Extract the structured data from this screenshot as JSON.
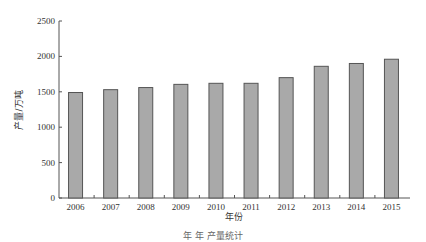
{
  "chart_data": {
    "type": "bar",
    "title": "",
    "xlabel": "年份",
    "ylabel": "产量/万吨",
    "categories": [
      "2006",
      "2007",
      "2008",
      "2009",
      "2010",
      "2011",
      "2012",
      "2013",
      "2014",
      "2015"
    ],
    "values": [
      1490,
      1530,
      1560,
      1605,
      1620,
      1620,
      1700,
      1860,
      1900,
      1960
    ],
    "ylim": [
      0,
      2500
    ],
    "yticks": [
      0,
      500,
      1000,
      1500,
      2000,
      2500
    ],
    "grid": false,
    "legend": null,
    "bar_color": "#a9a9a9",
    "bar_edge_color": "#555555"
  },
  "caption": "年 年 产量统计"
}
